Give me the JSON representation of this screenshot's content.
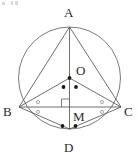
{
  "figure": {
    "kind": "circle-geometry-diagram",
    "canvas": {
      "width": 139,
      "height": 163,
      "background": "#ffffff"
    },
    "stroke_color": "#4a4a4a",
    "circle_stroke_color": "#6b6b6b",
    "mark_color": "#1a1a1a",
    "label_color": "#2b2b2b",
    "circumcircle": {
      "center_label": "O",
      "cx": 69.5,
      "cy": 78.0,
      "r": 51.0
    },
    "points": [
      {
        "id": "A",
        "label": "A",
        "x": 69.5,
        "y": 27.0,
        "label_x": 64.0,
        "label_y": 6.0
      },
      {
        "id": "B",
        "label": "B",
        "x": 19.0,
        "y": 107.0,
        "label_x": 3.0,
        "label_y": 105.0
      },
      {
        "id": "C",
        "label": "C",
        "x": 121.0,
        "y": 107.0,
        "label_x": 124.0,
        "label_y": 105.0
      },
      {
        "id": "D",
        "label": "D",
        "x": 69.5,
        "y": 129.0,
        "label_x": 64.0,
        "label_y": 141.0
      },
      {
        "id": "O",
        "label": "O",
        "x": 69.5,
        "y": 78.0,
        "label_x": 76.0,
        "label_y": 64.0
      },
      {
        "id": "M",
        "label": "M",
        "x": 69.5,
        "y": 107.0,
        "label_x": 73.0,
        "label_y": 110.0
      }
    ],
    "segments": [
      {
        "id": "AB",
        "from": "A",
        "to": "B"
      },
      {
        "id": "AC",
        "from": "A",
        "to": "C"
      },
      {
        "id": "AD",
        "from": "A",
        "to": "D"
      },
      {
        "id": "BC",
        "from": "B",
        "to": "C"
      },
      {
        "id": "BO",
        "from": "B",
        "to": "O"
      },
      {
        "id": "OC",
        "from": "O",
        "to": "C"
      },
      {
        "id": "BD",
        "from": "B",
        "to": "D"
      },
      {
        "id": "DC",
        "from": "D",
        "to": "C"
      }
    ],
    "tick_marks": [
      {
        "id": "tick-center-O",
        "on": "O",
        "x": 69.5,
        "y": 78.0,
        "r": 1.9
      },
      {
        "id": "tick-OB",
        "on": "BO",
        "x": 63.5,
        "y": 87.0,
        "r": 1.9
      },
      {
        "id": "tick-OC",
        "on": "OC",
        "x": 76.0,
        "y": 87.0,
        "r": 1.9
      },
      {
        "id": "tick-DB",
        "on": "BD",
        "x": 62.5,
        "y": 126.0,
        "r": 1.9
      },
      {
        "id": "tick-DC",
        "on": "DC",
        "x": 75.5,
        "y": 126.0,
        "r": 1.9
      }
    ],
    "angle_marks": [
      {
        "id": "angle-B-upper",
        "at": "B",
        "x": 38.0,
        "y": 102.0,
        "size": 3.0
      },
      {
        "id": "angle-B-lower",
        "at": "B",
        "x": 38.0,
        "y": 112.0,
        "size": 3.0
      },
      {
        "id": "angle-C-upper",
        "at": "C",
        "x": 102.0,
        "y": 102.0,
        "size": 3.0
      },
      {
        "id": "angle-C-lower",
        "at": "C",
        "x": 102.0,
        "y": 112.0,
        "size": 3.0
      }
    ],
    "right_angle": {
      "id": "right-angle-M",
      "at": "M",
      "x": 69.5,
      "y": 107.0,
      "size": 8.0,
      "opens": "upper-left"
    },
    "specks": [
      {
        "id": "speck-1",
        "x": 2.0,
        "y": 2.0,
        "w": 3.0,
        "h": 3.0
      },
      {
        "id": "speck-2",
        "x": 11.0,
        "y": 1.0,
        "w": 2.0,
        "h": 4.0
      },
      {
        "id": "speck-3",
        "x": 15.0,
        "y": 1.0,
        "w": 3.0,
        "h": 4.0
      }
    ]
  }
}
